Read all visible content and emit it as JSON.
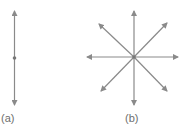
{
  "figure": {
    "stroke_color": "#8a8a8a",
    "dot_color": "#777777",
    "panels": [
      {
        "id": "a",
        "label": "(a)",
        "description": "single vertical double-headed line through a central point",
        "center": [
          14.5,
          58
        ],
        "arrows": [
          {
            "direction": "up",
            "from": [
              14.5,
              58
            ],
            "to": [
              14.5,
              11
            ]
          },
          {
            "direction": "down",
            "from": [
              14.5,
              58
            ],
            "to": [
              14.5,
              105
            ]
          }
        ]
      },
      {
        "id": "b",
        "label": "(b)",
        "description": "eight arrows radiating from a central point",
        "center": [
          134,
          57
        ],
        "arrows": [
          {
            "direction": "up",
            "to": [
              134,
              11
            ]
          },
          {
            "direction": "down",
            "to": [
              134,
              105
            ]
          },
          {
            "direction": "left",
            "to": [
              87,
              57
            ]
          },
          {
            "direction": "right",
            "to": [
              178,
              57
            ]
          },
          {
            "direction": "up-left",
            "to": [
              99,
              24
            ]
          },
          {
            "direction": "up-right",
            "to": [
              167,
              23
            ]
          },
          {
            "direction": "down-left",
            "to": [
              101,
              91
            ]
          },
          {
            "direction": "down-right",
            "to": [
              167,
              91
            ]
          }
        ]
      }
    ]
  }
}
